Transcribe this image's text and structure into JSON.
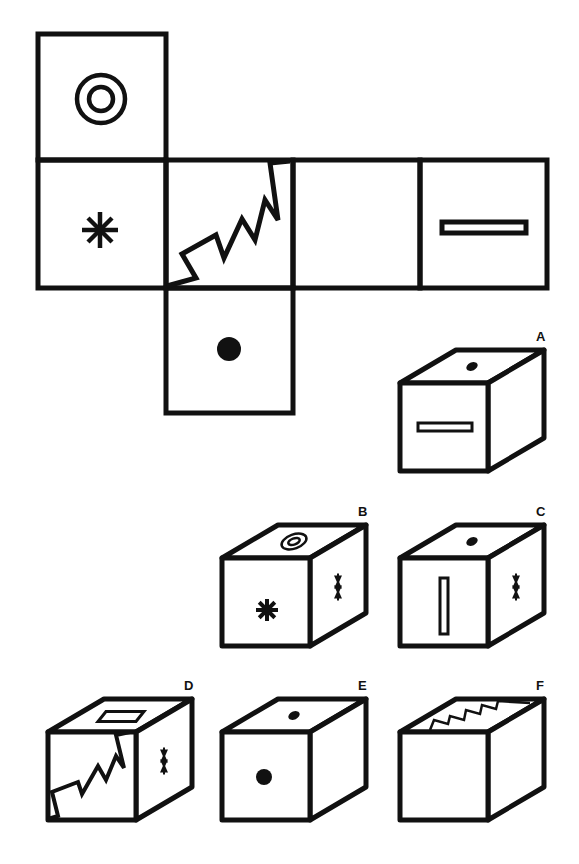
{
  "puzzle": {
    "type": "cube-net-folding",
    "ink_color": "#111111",
    "background": "#ffffff",
    "net": {
      "faces": [
        {
          "id": "top",
          "symbol": "double-circle"
        },
        {
          "id": "left",
          "symbol": "asterisk"
        },
        {
          "id": "center",
          "symbol": "zigzag"
        },
        {
          "id": "right",
          "symbol": "blank"
        },
        {
          "id": "far-right",
          "symbol": "bar-rectangle"
        },
        {
          "id": "bottom",
          "symbol": "dot"
        }
      ]
    },
    "options": [
      {
        "label": "A",
        "top": "dot",
        "front": "bar-rectangle-horizontal",
        "side": "blank"
      },
      {
        "label": "B",
        "top": "double-circle",
        "front": "asterisk",
        "side": "bowtie"
      },
      {
        "label": "C",
        "top": "dot",
        "front": "bar-rectangle-vertical",
        "side": "bowtie"
      },
      {
        "label": "D",
        "top": "bar-rectangle",
        "front": "zigzag",
        "side": "bowtie"
      },
      {
        "label": "E",
        "top": "dot",
        "front": "dot",
        "side": "blank"
      },
      {
        "label": "F",
        "top": "zigzag",
        "front": "blank",
        "side": "blank"
      }
    ]
  }
}
